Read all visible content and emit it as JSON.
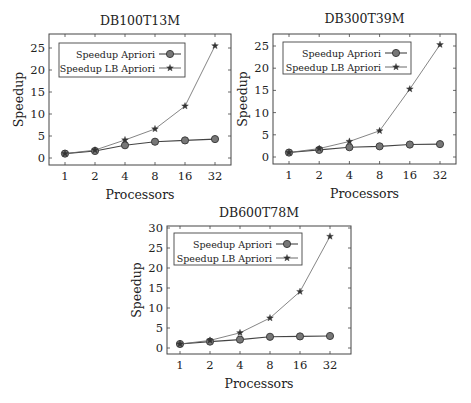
{
  "chart_data": [
    {
      "type": "line",
      "title": "DB100T13M",
      "xlabel": "Processors",
      "ylabel": "Speedup",
      "categories": [
        "1",
        "2",
        "4",
        "8",
        "16",
        "32"
      ],
      "x": [
        1,
        2,
        4,
        8,
        16,
        32
      ],
      "yticks": [
        0,
        5,
        10,
        15,
        20,
        25
      ],
      "ylim": [
        -1,
        27
      ],
      "legend_position": "upper left",
      "grid": false,
      "series": [
        {
          "name": "Speedup Apriori",
          "marker": "circle",
          "values": [
            1,
            1.6,
            2.9,
            3.7,
            4.0,
            4.3
          ]
        },
        {
          "name": "Speedup LB Apriori",
          "marker": "star",
          "values": [
            1,
            1.8,
            4.1,
            6.6,
            11.8,
            25.5
          ]
        }
      ]
    },
    {
      "type": "line",
      "title": "DB300T39M",
      "xlabel": "Processors",
      "ylabel": "Speedup",
      "categories": [
        "1",
        "2",
        "4",
        "8",
        "16",
        "32"
      ],
      "x": [
        1,
        2,
        4,
        8,
        16,
        32
      ],
      "yticks": [
        0,
        5,
        10,
        15,
        20,
        25
      ],
      "ylim": [
        -1,
        27
      ],
      "legend_position": "upper left",
      "grid": false,
      "series": [
        {
          "name": "Speedup Apriori",
          "marker": "circle",
          "values": [
            1,
            1.6,
            2.2,
            2.4,
            2.8,
            2.9
          ]
        },
        {
          "name": "Speedup LB Apriori",
          "marker": "star",
          "values": [
            1,
            1.9,
            3.5,
            5.9,
            15.3,
            25.3
          ]
        }
      ]
    },
    {
      "type": "line",
      "title": "DB600T78M",
      "xlabel": "Processors",
      "ylabel": "Speedup",
      "categories": [
        "1",
        "2",
        "4",
        "8",
        "16",
        "32"
      ],
      "x": [
        1,
        2,
        4,
        8,
        16,
        32
      ],
      "yticks": [
        0,
        5,
        10,
        15,
        20,
        25,
        30
      ],
      "ylim": [
        -1.5,
        30.5
      ],
      "legend_position": "upper left",
      "grid": false,
      "series": [
        {
          "name": "Speedup Apriori",
          "marker": "circle",
          "values": [
            1,
            1.6,
            2.1,
            2.8,
            2.9,
            3.0
          ]
        },
        {
          "name": "Speedup LB Apriori",
          "marker": "star",
          "values": [
            1,
            1.9,
            3.8,
            7.5,
            14.1,
            27.9
          ]
        }
      ]
    }
  ],
  "layout": [
    {
      "frame": {
        "x": 49,
        "y": 34,
        "w": 182,
        "h": 131
      },
      "y0px": 158,
      "ytopval": 25,
      "ytoppx": 48,
      "x1px": 65,
      "x32px": 215,
      "title_y": 25,
      "legend": {
        "x": 59,
        "y": 43,
        "w": 126,
        "h": 34
      }
    },
    {
      "frame": {
        "x": 273,
        "y": 34,
        "w": 183,
        "h": 130
      },
      "y0px": 157,
      "ytopval": 25,
      "ytoppx": 46,
      "x1px": 289,
      "x32px": 440,
      "title_y": 23,
      "legend": {
        "x": 283,
        "y": 42,
        "w": 128,
        "h": 32
      }
    },
    {
      "frame": {
        "x": 167,
        "y": 226,
        "w": 184,
        "h": 128
      },
      "y0px": 348,
      "ytopval": 30,
      "ytoppx": 228,
      "x1px": 180,
      "x32px": 330,
      "title_y": 217,
      "legend": {
        "x": 174,
        "y": 233,
        "w": 128,
        "h": 32
      }
    }
  ]
}
